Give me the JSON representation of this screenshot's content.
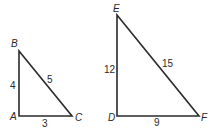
{
  "triangles": [
    {
      "name": "ABC",
      "vertices": {
        "A": {
          "label": "A",
          "x": 19,
          "y": 116
        },
        "B": {
          "label": "B",
          "x": 19,
          "y": 51
        },
        "C": {
          "label": "C",
          "x": 72,
          "y": 116
        }
      },
      "sides": {
        "AB": "4",
        "BC": "5",
        "AC": "3"
      }
    },
    {
      "name": "DEF",
      "vertices": {
        "D": {
          "label": "D",
          "x": 117,
          "y": 116
        },
        "E": {
          "label": "E",
          "x": 117,
          "y": 15
        },
        "F": {
          "label": "F",
          "x": 199,
          "y": 116
        }
      },
      "sides": {
        "DE": "12",
        "EF": "15",
        "DF": "9"
      }
    }
  ],
  "colors": {
    "stroke": "#2a2a2a",
    "background": "#ffffff"
  }
}
